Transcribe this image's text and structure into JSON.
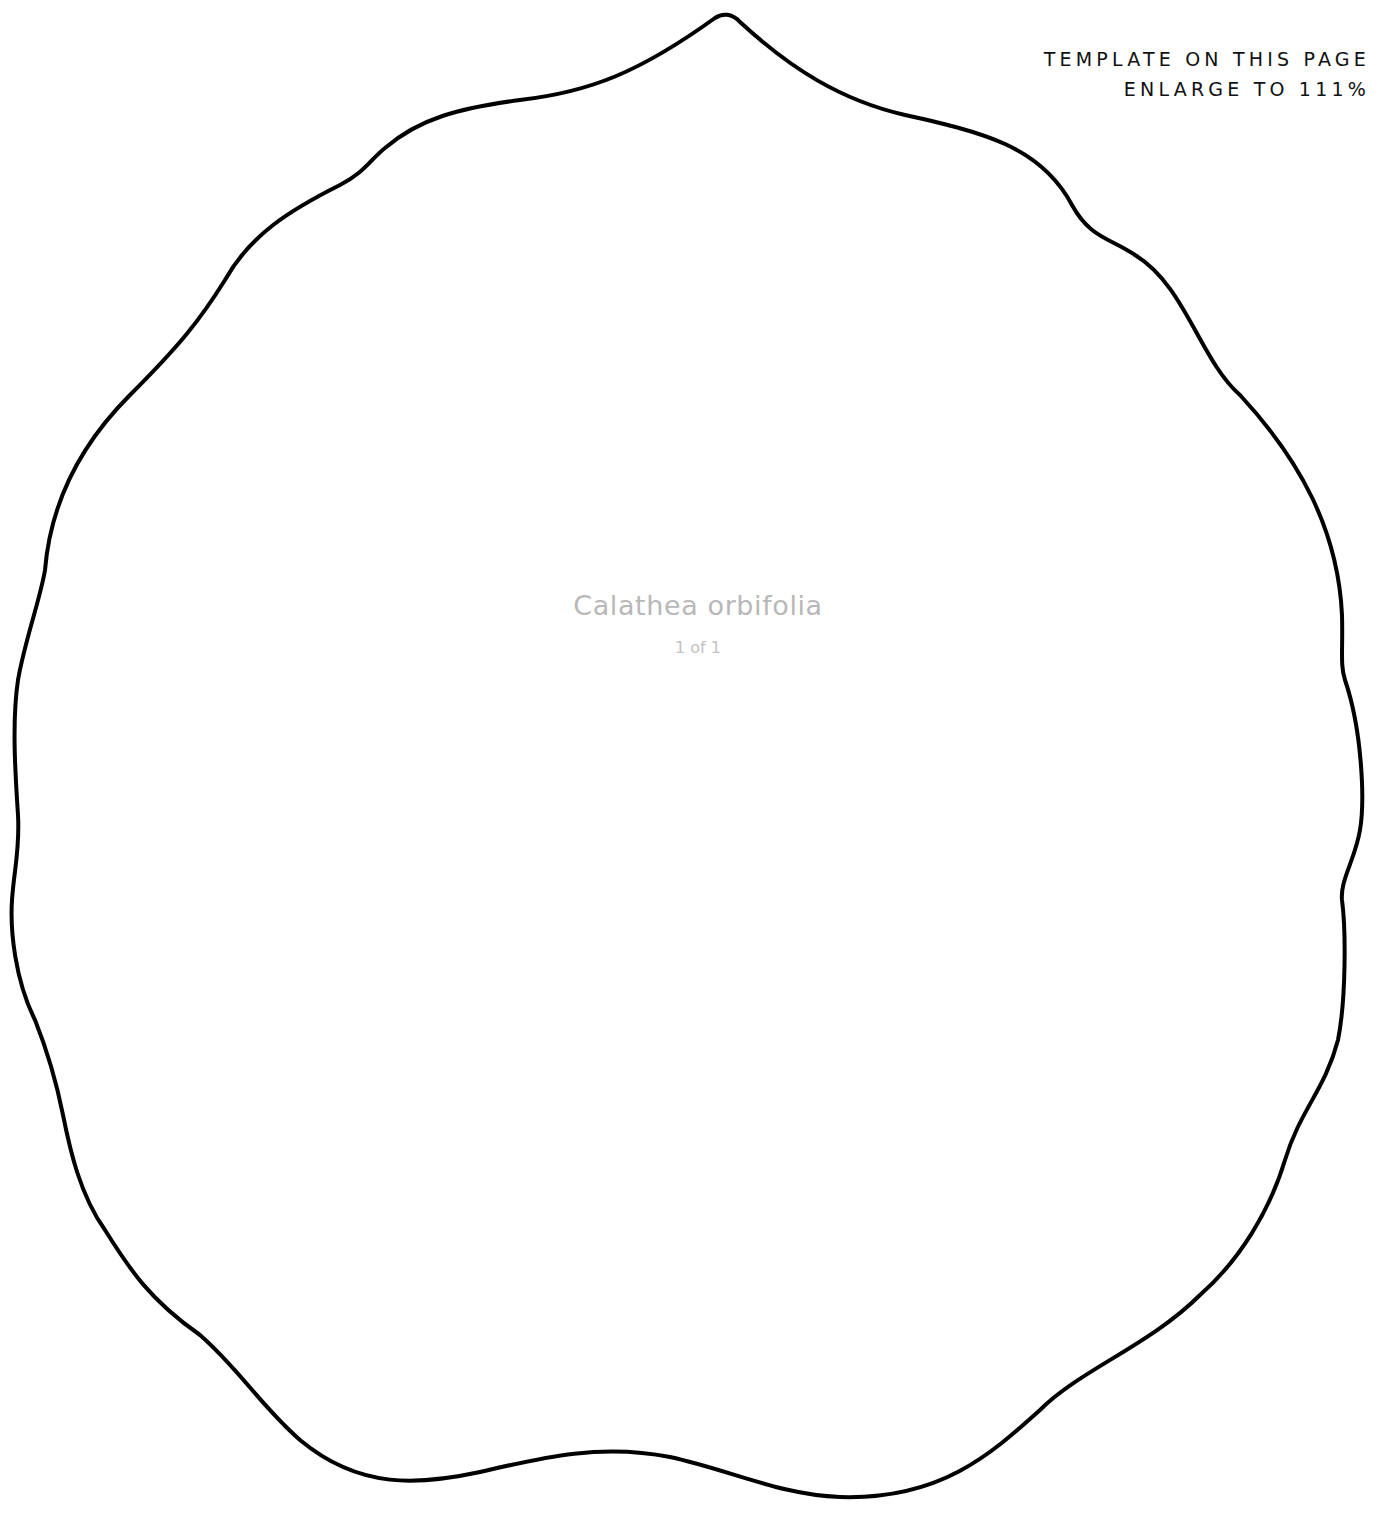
{
  "header": {
    "line1": "TEMPLATE ON THIS PAGE",
    "line2": "ENLARGE TO 111%"
  },
  "template": {
    "name": "Calathea orbifolia",
    "page_indicator": "1 of 1",
    "shape": "leaf-outline",
    "stroke_color": "#000000",
    "label_color": "#b8b8b8"
  }
}
